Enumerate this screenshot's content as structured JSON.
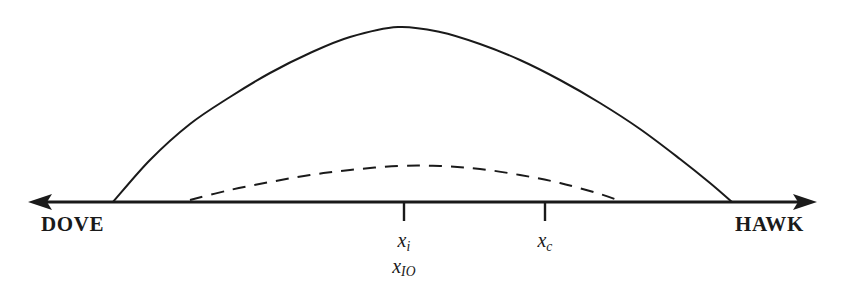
{
  "figure": {
    "background_color": "#ffffff",
    "stroke_color": "#1a1a1a",
    "axis": {
      "name": "policy-spectrum-axis",
      "left_endpoint_label": "DOVE",
      "right_endpoint_label": "HAWK",
      "left_arrow": "left-arrowhead",
      "right_arrow": "right-arrowhead",
      "y": 202,
      "x_start": 30,
      "x_end": 815
    },
    "ticks": [
      {
        "name": "tick-xi",
        "x": 404,
        "labels": [
          "x",
          "i",
          "x",
          "IO"
        ],
        "label_primary": "x",
        "label_primary_sub": "i",
        "label_secondary": "x",
        "label_secondary_sub": "IO"
      },
      {
        "name": "tick-xc",
        "x": 545,
        "label_primary": "x",
        "label_primary_sub": "c"
      }
    ]
  },
  "chart_data": {
    "type": "line",
    "title": "",
    "subtitle": "",
    "xlabel": "",
    "ylabel": "",
    "xlim": [
      30,
      815
    ],
    "ylim": [
      202,
      27
    ],
    "grid": false,
    "legend": null,
    "axis_tick_labels": [
      "x_i / x_IO",
      "x_c"
    ],
    "axis_endpoint_labels": [
      "DOVE",
      "HAWK"
    ],
    "series": [
      {
        "name": "solid-curve",
        "style": "solid",
        "color": "#1a1a1a",
        "linewidth": 2.0,
        "x": [
          113,
          150,
          190,
          230,
          270,
          310,
          350,
          398,
          440,
          480,
          520,
          560,
          600,
          640,
          680,
          710,
          732
        ],
        "y": [
          202,
          160,
          124,
          97,
          73,
          53,
          37,
          27,
          32,
          44,
          60,
          80,
          103,
          129,
          159,
          183,
          202
        ]
      },
      {
        "name": "dashed-curve",
        "style": "dashed",
        "color": "#1a1a1a",
        "linewidth": 2.0,
        "dash_pattern": [
          13,
          9
        ],
        "x": [
          190,
          230,
          270,
          310,
          350,
          398,
          440,
          480,
          520,
          560,
          600,
          620
        ],
        "y": [
          200,
          190,
          182,
          175,
          170,
          166,
          166,
          169,
          175,
          183,
          194,
          201
        ]
      }
    ]
  }
}
